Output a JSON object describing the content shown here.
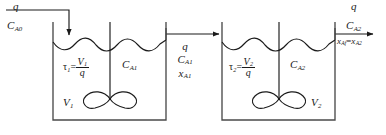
{
  "figure": {
    "type": "process-flow-diagram",
    "line_color": "#1a1a1a",
    "text_color": "#1a1a1a",
    "background": "#ffffff"
  },
  "streams": {
    "feed": {
      "flow_symbol": "q",
      "concentration_symbol": "C",
      "concentration_subscript": "A0",
      "arrow": "down-arrow-icon"
    },
    "intermediate": {
      "flow_symbol": "q",
      "concentration_symbol": "C",
      "concentration_subscript": "A1",
      "conversion_symbol": "x",
      "conversion_subscript": "A1",
      "arrow": "right-arrow-icon"
    },
    "product": {
      "flow_symbol": "q",
      "concentration_symbol": "C",
      "concentration_subscript": "A2",
      "conversion_expression_left": "x",
      "conversion_expression_left_sub": "Af",
      "conversion_expression_right": "x",
      "conversion_expression_right_sub": "A2",
      "equals": "=",
      "arrow": "right-arrow-icon"
    }
  },
  "tanks": [
    {
      "id": "tank-1",
      "volume_symbol": "V",
      "volume_subscript": "1",
      "concentration_symbol": "C",
      "concentration_subscript": "A1",
      "residence_time_symbol": "τ",
      "residence_time_subscript": "1",
      "residence_time_equals": "=",
      "residence_time_numerator": "V",
      "residence_time_numerator_sub": "1",
      "residence_time_denominator": "q",
      "agitator": "impeller-icon"
    },
    {
      "id": "tank-2",
      "volume_symbol": "V",
      "volume_subscript": "2",
      "concentration_symbol": "C",
      "concentration_subscript": "A2",
      "residence_time_symbol": "τ",
      "residence_time_subscript": "2",
      "residence_time_equals": "=",
      "residence_time_numerator": "V",
      "residence_time_numerator_sub": "2",
      "residence_time_denominator": "q",
      "agitator": "impeller-icon"
    }
  ]
}
